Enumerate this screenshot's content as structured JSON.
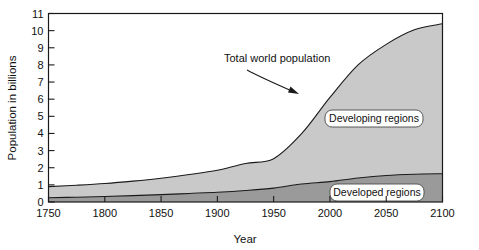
{
  "chart_data": {
    "type": "area",
    "stacked": true,
    "title": "",
    "xlabel": "Year",
    "ylabel": "Population in billions",
    "xlim": [
      1750,
      2100
    ],
    "ylim": [
      0,
      11
    ],
    "xticks": [
      1750,
      1800,
      1850,
      1900,
      1950,
      2000,
      2050,
      2100
    ],
    "yticks": [
      0,
      1,
      2,
      3,
      4,
      5,
      6,
      7,
      8,
      9,
      10,
      11
    ],
    "grid": false,
    "legend_position": "inline-annotations",
    "x": [
      1750,
      1775,
      1800,
      1825,
      1850,
      1875,
      1900,
      1925,
      1950,
      1975,
      2000,
      2025,
      2050,
      2075,
      2100
    ],
    "series": [
      {
        "name": "Developed regions",
        "color": "#9a9a9a",
        "values": [
          0.25,
          0.28,
          0.32,
          0.37,
          0.43,
          0.5,
          0.57,
          0.67,
          0.81,
          1.05,
          1.19,
          1.4,
          1.55,
          1.62,
          1.65
        ]
      },
      {
        "name": "Developing regions",
        "color": "#c9c9c9",
        "values": [
          0.65,
          0.7,
          0.76,
          0.85,
          0.96,
          1.1,
          1.28,
          1.58,
          1.72,
          2.95,
          4.91,
          6.6,
          7.65,
          8.43,
          8.75
        ]
      }
    ],
    "total_series": {
      "name": "Total world population",
      "values": [
        0.9,
        0.98,
        1.08,
        1.22,
        1.39,
        1.6,
        1.85,
        2.25,
        2.53,
        4.0,
        6.1,
        8.0,
        9.2,
        10.05,
        10.4
      ]
    },
    "annotations": [
      {
        "text": "Total world population",
        "type": "arrow-callout",
        "points_to_year": 2005,
        "points_to_value": 7.0
      },
      {
        "text": "Developing regions",
        "type": "inline-label"
      },
      {
        "text": "Developed regions",
        "type": "inline-label"
      }
    ]
  },
  "axes": {
    "y_label": "Population in billions",
    "x_label": "Year",
    "y_ticks": [
      "0",
      "1",
      "2",
      "3",
      "4",
      "5",
      "6",
      "7",
      "8",
      "9",
      "10",
      "11"
    ],
    "x_ticks": [
      "1750",
      "1800",
      "1850",
      "1900",
      "1950",
      "2000",
      "2050",
      "2100"
    ]
  },
  "labels": {
    "total": "Total world population",
    "developing": "Developing regions",
    "developed": "Developed regions"
  },
  "colors": {
    "developed_fill": "#9a9a9a",
    "developing_fill": "#c9c9c9",
    "line": "#1a1a1a",
    "axis": "#1a1a1a",
    "text": "#111111",
    "background": "#ffffff"
  }
}
